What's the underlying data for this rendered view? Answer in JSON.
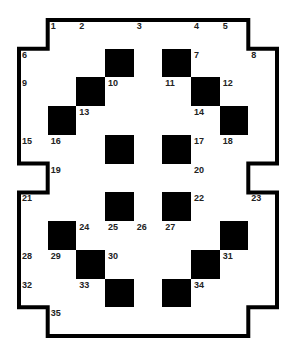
{
  "puzzle": {
    "type": "crossword",
    "rows": 11,
    "cols": 9,
    "legend": {
      "#": "black square",
      ".": "white square",
      "_": "outside grid",
      "o": "open center area"
    },
    "grid": [
      "_......._",
      "...#.#...",
      "..#...#..",
      ".#.....#.",
      "...#o#...",
      "_..ooo.._",
      "...#o#...",
      ".#.....#.",
      "..#...#..",
      "...#.#...",
      "_......._"
    ],
    "numbers": [
      {
        "n": "1",
        "r": 0,
        "c": 1
      },
      {
        "n": "2",
        "r": 0,
        "c": 2
      },
      {
        "n": "3",
        "r": 0,
        "c": 4
      },
      {
        "n": "4",
        "r": 0,
        "c": 6
      },
      {
        "n": "5",
        "r": 0,
        "c": 7
      },
      {
        "n": "6",
        "r": 1,
        "c": 0
      },
      {
        "n": "7",
        "r": 1,
        "c": 6
      },
      {
        "n": "8",
        "r": 1,
        "c": 8
      },
      {
        "n": "9",
        "r": 2,
        "c": 0
      },
      {
        "n": "10",
        "r": 2,
        "c": 3
      },
      {
        "n": "11",
        "r": 2,
        "c": 5
      },
      {
        "n": "12",
        "r": 2,
        "c": 7
      },
      {
        "n": "13",
        "r": 3,
        "c": 2
      },
      {
        "n": "14",
        "r": 3,
        "c": 6
      },
      {
        "n": "15",
        "r": 4,
        "c": 0
      },
      {
        "n": "16",
        "r": 4,
        "c": 1
      },
      {
        "n": "17",
        "r": 4,
        "c": 6
      },
      {
        "n": "18",
        "r": 4,
        "c": 7
      },
      {
        "n": "19",
        "r": 5,
        "c": 1
      },
      {
        "n": "20",
        "r": 5,
        "c": 6
      },
      {
        "n": "21",
        "r": 6,
        "c": 0
      },
      {
        "n": "22",
        "r": 6,
        "c": 6
      },
      {
        "n": "23",
        "r": 6,
        "c": 8
      },
      {
        "n": "24",
        "r": 7,
        "c": 2
      },
      {
        "n": "25",
        "r": 7,
        "c": 3
      },
      {
        "n": "26",
        "r": 7,
        "c": 4
      },
      {
        "n": "27",
        "r": 7,
        "c": 5
      },
      {
        "n": "28",
        "r": 8,
        "c": 0
      },
      {
        "n": "29",
        "r": 8,
        "c": 1
      },
      {
        "n": "30",
        "r": 8,
        "c": 3
      },
      {
        "n": "31",
        "r": 8,
        "c": 7
      },
      {
        "n": "32",
        "r": 9,
        "c": 0
      },
      {
        "n": "33",
        "r": 9,
        "c": 2
      },
      {
        "n": "34",
        "r": 9,
        "c": 6
      },
      {
        "n": "35",
        "r": 10,
        "c": 1
      }
    ],
    "colors": {
      "black": "#000000",
      "white": "#ffffff",
      "gridline": "#8a8a8a",
      "border": "#000000"
    }
  }
}
